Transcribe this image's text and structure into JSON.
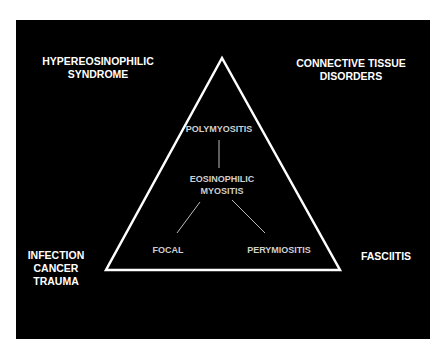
{
  "diagram": {
    "background": "#000000",
    "line_color": "#ffffff",
    "corners": {
      "top_left": "HYPEREOSINOPHILIC\nSYNDROME",
      "top_right": "CONNECTIVE TISSUE\nDISORDERS",
      "bottom_left": "INFECTION\nCANCER\nTRAUMA",
      "bottom_right": "FASCIITIS"
    },
    "triangle": {
      "top": "POLYMYOSITIS",
      "center": "EOSINOPHILIC\nMYOSITIS",
      "bottom_left": "FOCAL",
      "bottom_right": "PERYMIOSITIS"
    }
  }
}
